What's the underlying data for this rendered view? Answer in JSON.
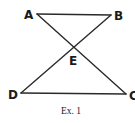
{
  "figure": {
    "caption": "Ex. 1",
    "points": {
      "A": {
        "label": "A",
        "x": 37,
        "y": 14
      },
      "B": {
        "label": "B",
        "x": 111,
        "y": 15
      },
      "C": {
        "label": "C",
        "x": 126,
        "y": 94
      },
      "D": {
        "label": "D",
        "x": 21,
        "y": 93
      },
      "E": {
        "label": "E",
        "x": 73,
        "y": 48
      }
    },
    "segments": [
      "AB",
      "DC",
      "AC",
      "BD"
    ],
    "colors": {
      "line": "#2a2a2a",
      "label": "#1a1a1a",
      "background": "#ffffff"
    }
  }
}
